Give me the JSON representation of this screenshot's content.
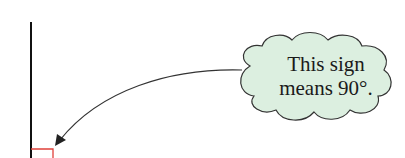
{
  "callout": {
    "line1": "This sign",
    "line2": "means 90°.",
    "fill": "#dcefe0",
    "stroke": "#333333"
  },
  "diagram": {
    "line_color": "#111111",
    "right_angle_marker_color": "#e0403a",
    "arrow_color": "#333333"
  }
}
